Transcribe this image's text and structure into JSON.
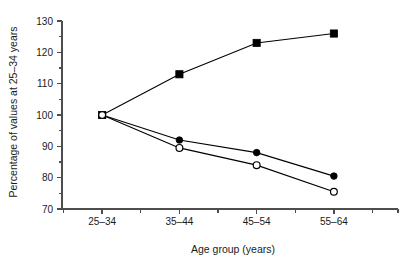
{
  "chart_data": {
    "type": "line",
    "title": "",
    "subtitle": "",
    "xlabel": "Age group (years)",
    "ylabel": "Percentage of values at 25–34 years",
    "categories": [
      "25–34",
      "35–44",
      "45–54",
      "55–64"
    ],
    "ylim": [
      70,
      130
    ],
    "ytick_labels": [
      "70",
      "80",
      "90",
      "100",
      "110",
      "120",
      "130"
    ],
    "ytick_values": [
      70,
      80,
      90,
      100,
      110,
      120,
      130
    ],
    "yminor_step": 5,
    "grid": false,
    "legend": "none",
    "series": [
      {
        "name": "filled-square-series",
        "marker": "filled-square",
        "values": [
          100,
          113,
          123,
          126
        ]
      },
      {
        "name": "filled-circle-series",
        "marker": "filled-circle",
        "values": [
          100,
          92,
          88,
          80.5
        ]
      },
      {
        "name": "open-circle-series",
        "marker": "open-circle",
        "values": [
          100,
          89.5,
          84,
          75.5
        ]
      }
    ],
    "colors": {
      "line": "#000000",
      "marker_fill": "#000000",
      "marker_open_fill": "#ffffff",
      "axis": "#4d4d4d",
      "text": "#1a1a1a",
      "background": "#ffffff"
    }
  }
}
